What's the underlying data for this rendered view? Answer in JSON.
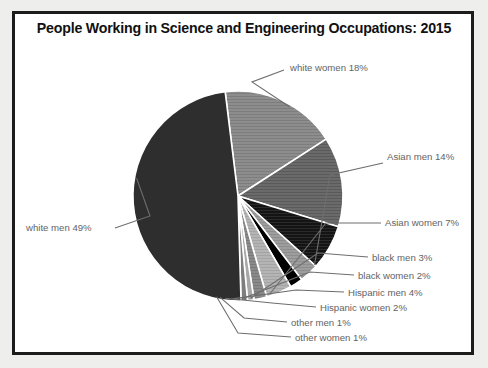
{
  "header": {
    "title": "People Working in Science and Engineering Occupations: 2015"
  },
  "colors": {
    "white_men": "#2e2e2e",
    "white_women": "#8d8d8d",
    "asian_men": "#6a6a6a",
    "asian_women": "#141414",
    "black_men": "#9d9d9d",
    "black_women": "#000000",
    "hispanic_men": "#b4b4b4",
    "hispanic_women": "#8a8a8a",
    "other_men": "#a8a8a8",
    "other_women": "#7e7e7e",
    "slice_border": "#ffffff",
    "frame": "#1c1c1c",
    "label_text": "#636363",
    "leader_line": "#6e6e6e",
    "page_background": "#eeeeec",
    "plot_background": "#ffffff"
  },
  "chart_data": {
    "type": "pie",
    "title": "People Working in Science and Engineering Occupations: 2015",
    "xlabel": "",
    "ylabel": "",
    "units": "percent",
    "legend_position": "none",
    "grid": false,
    "start_angle_deg": -7,
    "direction": "clockwise",
    "categories": [
      "white women",
      "Asian men",
      "Asian women",
      "black men",
      "black women",
      "Hispanic men",
      "Hispanic women",
      "other men",
      "other women",
      "white men"
    ],
    "values": [
      18,
      14,
      7,
      3,
      2,
      4,
      2,
      1,
      1,
      49
    ],
    "slices": [
      {
        "key": "white_women",
        "label": "white women 18%",
        "name": "white women",
        "value": 18,
        "color": "#8d8d8d",
        "hatch": "hlines"
      },
      {
        "key": "asian_men",
        "label": "Asian men 14%",
        "name": "Asian men",
        "value": 14,
        "color": "#6a6a6a",
        "hatch": "hlines"
      },
      {
        "key": "asian_women",
        "label": "Asian women 7%",
        "name": "Asian women",
        "value": 7,
        "color": "#141414",
        "hatch": "hlines"
      },
      {
        "key": "black_men",
        "label": "black men 3%",
        "name": "black men",
        "value": 3,
        "color": "#9d9d9d",
        "hatch": "hlines"
      },
      {
        "key": "black_women",
        "label": "black women 2%",
        "name": "black women",
        "value": 2,
        "color": "#000000",
        "hatch": "none"
      },
      {
        "key": "hispanic_men",
        "label": "Hispanic men 4%",
        "name": "Hispanic men",
        "value": 4,
        "color": "#b4b4b4",
        "hatch": "hlines"
      },
      {
        "key": "hispanic_women",
        "label": "Hispanic women 2%",
        "name": "Hispanic women",
        "value": 2,
        "color": "#8a8a8a",
        "hatch": "hlines"
      },
      {
        "key": "other_men",
        "label": "other men 1%",
        "name": "other men",
        "value": 1,
        "color": "#a8a8a8",
        "hatch": "none"
      },
      {
        "key": "other_women",
        "label": "other women 1%",
        "name": "other women",
        "value": 1,
        "color": "#7e7e7e",
        "hatch": "none"
      },
      {
        "key": "white_men",
        "label": "white men 49%",
        "name": "white men",
        "value": 49,
        "color": "#2e2e2e",
        "hatch": "none"
      }
    ]
  },
  "labels": {
    "white_women": "white women 18%",
    "asian_men": "Asian men 14%",
    "asian_women": "Asian women 7%",
    "black_men": "black men 3%",
    "black_women": "black women 2%",
    "hispanic_men": "Hispanic men 4%",
    "hispanic_women": "Hispanic women 2%",
    "other_men": "other men 1%",
    "other_women": "other women 1%",
    "white_men": "white men 49%"
  }
}
